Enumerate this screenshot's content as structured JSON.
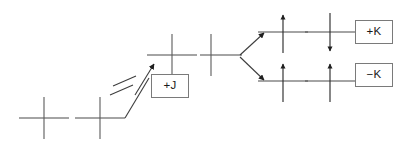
{
  "figure": {
    "background_color": "#ffffff",
    "line_color": "#4a4a4a",
    "arrow_color": "#1f1f1f",
    "box_border_color": "#7a7a7a"
  },
  "labels": {
    "coulomb": "+J",
    "exchange_up": "+K",
    "exchange_down": "−K"
  },
  "levels": [
    {
      "id": "level-unperturbed",
      "name": "unperturbed-level",
      "cx": 44,
      "cy": 118,
      "half_width": 25,
      "half_height": 21,
      "spin": "none"
    },
    {
      "id": "level-base",
      "name": "base-level",
      "cx": 100,
      "cy": 118,
      "half_width": 25,
      "half_height": 21,
      "spin": "none"
    },
    {
      "id": "level-coulomb",
      "name": "coulomb-shifted-level",
      "cx": 172,
      "cy": 55,
      "half_width": 25,
      "half_height": 21,
      "spin": "none"
    },
    {
      "id": "level-split-origin",
      "name": "split-origin-level",
      "cx": 211,
      "cy": 55,
      "half_width": 25,
      "half_height": 21,
      "spin": "none"
    },
    {
      "id": "level-up-a",
      "name": "upper-branch-level-left",
      "cx": 283,
      "cy": 32,
      "half_width": 25,
      "half_height": 21,
      "spin": "up"
    },
    {
      "id": "level-up-b",
      "name": "upper-branch-level-right",
      "cx": 330,
      "cy": 32,
      "half_width": 25,
      "half_height": 21,
      "spin": "down"
    },
    {
      "id": "level-dn-a",
      "name": "lower-branch-level-left",
      "cx": 283,
      "cy": 81,
      "half_width": 25,
      "half_height": 21,
      "spin": "up"
    },
    {
      "id": "level-dn-b",
      "name": "lower-branch-level-right",
      "cx": 330,
      "cy": 81,
      "half_width": 25,
      "half_height": 21,
      "spin": "up"
    }
  ],
  "connectors": [
    {
      "name": "coulomb-riser",
      "type": "polyline-arrow",
      "points": "125,118 148,79 152,72",
      "has_break": true
    },
    {
      "name": "split-arrow-up",
      "type": "arrow",
      "x1": 238,
      "y1": 55,
      "x2": 262,
      "y2": 33
    },
    {
      "name": "split-arrow-down",
      "type": "arrow",
      "x1": 238,
      "y1": 57,
      "x2": 262,
      "y2": 80
    }
  ],
  "boxes": [
    {
      "name": "coulomb-label-box",
      "label_key": "coulomb",
      "left": 151,
      "top": 74,
      "width": 38,
      "height": 24
    },
    {
      "name": "exchange-up-label-box",
      "label_key": "exchange_up",
      "left": 355,
      "top": 20,
      "width": 38,
      "height": 24
    },
    {
      "name": "exchange-down-label-box",
      "label_key": "exchange_down",
      "left": 355,
      "top": 63,
      "width": 38,
      "height": 24
    }
  ]
}
